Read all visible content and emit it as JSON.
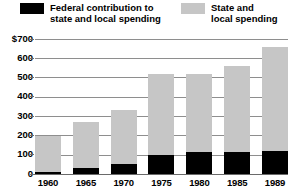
{
  "legend": {
    "items": [
      {
        "key": "federal",
        "label": "Federal contribution to\nstate and local spending",
        "color": "#000000"
      },
      {
        "key": "state",
        "label": "State and\nlocal spending",
        "color": "#c6c6c6"
      }
    ]
  },
  "axis": {
    "y_ticks": [
      "$700",
      "600",
      "500",
      "400",
      "300",
      "200",
      "100",
      "0"
    ],
    "x_ticks": [
      "1960",
      "1965",
      "1970",
      "1975",
      "1980",
      "1985",
      "1989"
    ]
  },
  "chart_data": {
    "type": "bar",
    "title": "",
    "xlabel": "",
    "ylabel": "",
    "stacked": true,
    "grid": true,
    "legend_position": "top",
    "ylim": [
      0,
      700
    ],
    "ytick_values": [
      0,
      100,
      200,
      300,
      400,
      500,
      600,
      700
    ],
    "ytick_labels": [
      "0",
      "100",
      "200",
      "300",
      "400",
      "500",
      "600",
      "$700"
    ],
    "categories": [
      "1960",
      "1965",
      "1970",
      "1975",
      "1980",
      "1985",
      "1989"
    ],
    "series": [
      {
        "name": "Federal contribution to state and local spending",
        "color": "#000000",
        "values": [
          10,
          30,
          50,
          100,
          115,
          115,
          120
        ]
      },
      {
        "name": "State and local spending",
        "color": "#c6c6c6",
        "values": [
          185,
          240,
          280,
          420,
          405,
          445,
          540
        ]
      }
    ],
    "totals": [
      195,
      270,
      330,
      520,
      520,
      560,
      660
    ]
  }
}
